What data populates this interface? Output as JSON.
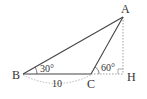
{
  "diagram": {
    "type": "triangle",
    "vertices": {
      "A": {
        "label": "A",
        "x": 123,
        "y": 17
      },
      "B": {
        "label": "B",
        "x": 23,
        "y": 74
      },
      "C": {
        "label": "C",
        "x": 91,
        "y": 74
      },
      "H": {
        "label": "H",
        "x": 123,
        "y": 74
      }
    },
    "angles": {
      "B": {
        "label": "30°"
      },
      "ACH": {
        "label": "60°"
      }
    },
    "lengths": {
      "BC": {
        "label": "10"
      }
    },
    "colors": {
      "line": "#444444",
      "dashed": "#888888",
      "text": "#333333"
    }
  }
}
